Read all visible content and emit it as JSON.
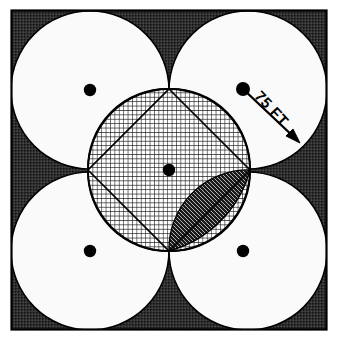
{
  "figure": {
    "kind": "geometric-diagram",
    "background_color": "#ffffff",
    "frame": {
      "stroke_color": "#000000",
      "fill_color": "#2b2b2b",
      "x": 11,
      "y": 10,
      "width": 316,
      "height": 320,
      "stroke_width": 2
    },
    "annotation": {
      "dimension_label": "75 FT",
      "label_rotation_deg": 45,
      "label_x": 268,
      "label_y": 112,
      "leader_from_x": 243,
      "leader_from_y": 89,
      "leader_to_x": 299,
      "leader_to_y": 142,
      "arrow_color": "#000000"
    },
    "outer_circles": {
      "count": 4,
      "radius": 79,
      "fill_color": "#fafafa",
      "stroke_color": "#000000",
      "centers": [
        {
          "name": "top-left",
          "x": 90,
          "y": 90
        },
        {
          "name": "top-right",
          "x": 248,
          "y": 90
        },
        {
          "name": "bottom-left",
          "x": 90,
          "y": 251
        },
        {
          "name": "bottom-right",
          "x": 248,
          "y": 251
        }
      ],
      "center_dot_radius": 6,
      "center_dot_color": "#000000"
    },
    "inner_circle": {
      "name": "central-circle",
      "center_x": 169,
      "center_y": 170,
      "radius": 81,
      "fill_color": "none",
      "stroke_color": "#000000",
      "center_dot_radius": 6,
      "center_dot_color": "#000000"
    },
    "inscribed_square": {
      "name": "inscribed-diamond",
      "vertices": [
        {
          "x": 169,
          "y": 89
        },
        {
          "x": 250,
          "y": 170
        },
        {
          "x": 169,
          "y": 251
        },
        {
          "x": 88,
          "y": 170
        }
      ],
      "stroke_color": "#000000",
      "fill_pattern": "crosshatch-light"
    },
    "astroid_region": {
      "name": "concave-arc-region",
      "description": "four concave circular arcs joining the diamond vertices",
      "fill_pattern": "crosshatch-dense",
      "stroke_color": "#000000"
    },
    "dark_lens_region": {
      "name": "shaded-lens",
      "description": "dark hatched lens between inner circle arc and concave arc, lower-right quadrant",
      "fill_pattern": "diagonal-dark",
      "stroke_color": "#000000"
    }
  }
}
